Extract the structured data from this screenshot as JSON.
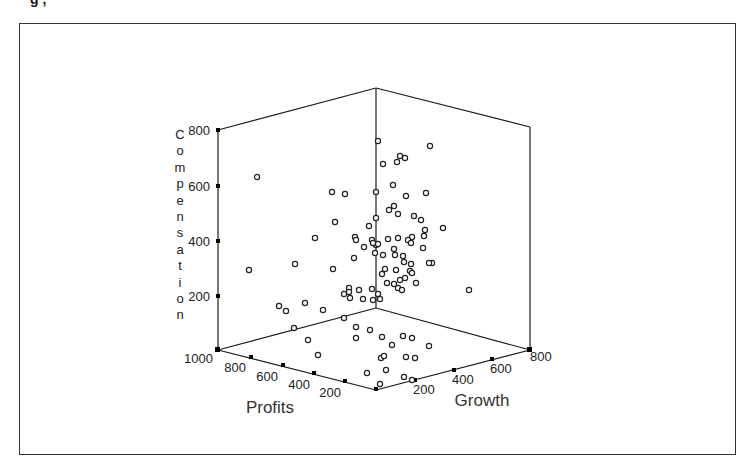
{
  "figure": {
    "clipped_heading": "g                                    ,"
  },
  "chart_data": {
    "type": "scatter",
    "subtype": "3d-scatter",
    "title": "",
    "axes": {
      "z": {
        "label": "Compensation",
        "ticks": [
          "200",
          "400",
          "600",
          "800"
        ],
        "range": [
          0,
          800
        ]
      },
      "x": {
        "label": "Profits",
        "ticks": [
          "1000",
          "800",
          "600",
          "400",
          "200"
        ],
        "range": [
          0,
          1000
        ]
      },
      "y": {
        "label": "Growth",
        "ticks": [
          "200",
          "400",
          "600",
          "800"
        ],
        "range": [
          0,
          800
        ]
      }
    },
    "grid": false,
    "legend": null,
    "marker": "open-circle",
    "points_screen": [
      [
        257,
        177
      ],
      [
        332,
        192
      ],
      [
        345,
        194
      ],
      [
        378,
        141
      ],
      [
        383,
        164
      ],
      [
        397,
        162
      ],
      [
        400,
        156
      ],
      [
        405,
        158
      ],
      [
        430,
        146
      ],
      [
        376,
        192
      ],
      [
        393,
        185
      ],
      [
        426,
        193
      ],
      [
        376,
        218
      ],
      [
        394,
        206
      ],
      [
        398,
        214
      ],
      [
        335,
        222
      ],
      [
        355,
        237
      ],
      [
        389,
        210
      ],
      [
        406,
        196
      ],
      [
        414,
        216
      ],
      [
        421,
        220
      ],
      [
        376,
        245
      ],
      [
        388,
        239
      ],
      [
        398,
        238
      ],
      [
        412,
        237
      ],
      [
        424,
        236
      ],
      [
        425,
        230
      ],
      [
        443,
        228
      ],
      [
        369,
        226
      ],
      [
        372,
        240
      ],
      [
        378,
        244
      ],
      [
        373,
        243
      ],
      [
        315,
        238
      ],
      [
        354,
        258
      ],
      [
        364,
        247
      ],
      [
        356,
        240
      ],
      [
        394,
        249
      ],
      [
        375,
        253
      ],
      [
        383,
        255
      ],
      [
        395,
        255
      ],
      [
        403,
        256
      ],
      [
        404,
        262
      ],
      [
        410,
        271
      ],
      [
        411,
        264
      ],
      [
        432,
        263
      ],
      [
        396,
        270
      ],
      [
        400,
        280
      ],
      [
        412,
        273
      ],
      [
        416,
        283
      ],
      [
        423,
        248
      ],
      [
        408,
        240
      ],
      [
        411,
        243
      ],
      [
        382,
        274
      ],
      [
        385,
        269
      ],
      [
        387,
        283
      ],
      [
        398,
        288
      ],
      [
        402,
        290
      ],
      [
        405,
        278
      ],
      [
        394,
        284
      ],
      [
        378,
        294
      ],
      [
        380,
        299
      ],
      [
        373,
        300
      ],
      [
        372,
        289
      ],
      [
        359,
        290
      ],
      [
        349,
        288
      ],
      [
        349,
        292
      ],
      [
        333,
        269
      ],
      [
        295,
        264
      ],
      [
        249,
        270
      ],
      [
        305,
        303
      ],
      [
        279,
        306
      ],
      [
        286,
        311
      ],
      [
        344,
        294
      ],
      [
        350,
        298
      ],
      [
        363,
        299
      ],
      [
        429,
        263
      ],
      [
        469,
        290
      ],
      [
        323,
        310
      ],
      [
        308,
        340
      ],
      [
        356,
        327
      ],
      [
        356,
        338
      ],
      [
        370,
        330
      ],
      [
        294,
        328
      ],
      [
        344,
        318
      ],
      [
        382,
        337
      ],
      [
        392,
        345
      ],
      [
        403,
        336
      ],
      [
        412,
        338
      ],
      [
        429,
        346
      ],
      [
        415,
        358
      ],
      [
        406,
        357
      ],
      [
        381,
        358
      ],
      [
        318,
        355
      ],
      [
        367,
        373
      ],
      [
        386,
        370
      ],
      [
        404,
        377
      ],
      [
        412,
        380
      ],
      [
        380,
        384
      ],
      [
        384,
        356
      ]
    ]
  }
}
